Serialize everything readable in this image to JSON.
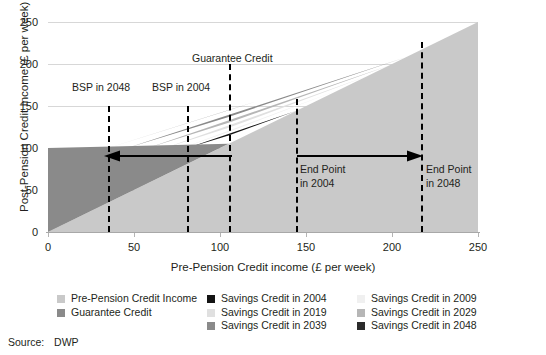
{
  "chart_data": {
    "type": "area",
    "title": "",
    "xlabel": "Pre-Pension Credit income (£ per week)",
    "ylabel": "Post-Pension Credit Income (£ per week)",
    "xlim": [
      0,
      250
    ],
    "ylim": [
      0,
      250
    ],
    "xticks": [
      0,
      50,
      100,
      150,
      200,
      250
    ],
    "yticks": [
      0,
      50,
      100,
      150,
      200,
      250
    ],
    "grid": true,
    "legend_position": "bottom",
    "series": [
      {
        "name": "Pre-Pension Credit Income",
        "color": "#c9c9c9",
        "description": "Identity line y = x filling the area below it across the whole range"
      },
      {
        "name": "Guarantee Credit",
        "color": "#8a8a8a",
        "description": "Flat top-up to £100 per week for pre-credit income between 0 and 105",
        "points": [
          [
            0,
            100
          ],
          [
            105,
            105
          ]
        ]
      },
      {
        "name": "Savings Credit in 2004",
        "color": "#141414",
        "description": "Savings credit taper from BSP in 2004 (£81) to end point in 2004 (£144)",
        "points": [
          [
            81,
            100
          ],
          [
            105,
            115
          ],
          [
            144,
            144
          ]
        ]
      },
      {
        "name": "Savings Credit in 2009",
        "color": "#f0f0f0",
        "description": "Savings credit band, 2009 taper",
        "points": [
          [
            78,
            100
          ],
          [
            105,
            119
          ],
          [
            170,
            170
          ]
        ]
      },
      {
        "name": "Savings Credit in 2019",
        "color": "#e0e0e0",
        "description": "Savings credit band, 2019 taper",
        "points": [
          [
            68,
            100
          ],
          [
            105,
            124
          ],
          [
            185,
            185
          ]
        ]
      },
      {
        "name": "Savings Credit in 2029",
        "color": "#b6b6b6",
        "description": "Savings credit band, 2029 taper",
        "points": [
          [
            58,
            100
          ],
          [
            105,
            130
          ],
          [
            198,
            198
          ]
        ]
      },
      {
        "name": "Savings Credit in 2039",
        "color": "#8a8a8a",
        "description": "Savings credit band, 2039 taper",
        "points": [
          [
            46,
            100
          ],
          [
            105,
            137
          ],
          [
            208,
            208
          ]
        ]
      },
      {
        "name": "Savings Credit in 2048",
        "color": "#2b2b2b",
        "description": "Savings credit band, 2048 taper; topmost band reaching end point in 2048 (£217)",
        "points": [
          [
            35,
            100
          ],
          [
            105,
            145
          ],
          [
            217,
            217
          ]
        ]
      }
    ],
    "markers": [
      {
        "label": "BSP in 2048",
        "x": 35,
        "type": "vertical-dashed"
      },
      {
        "label": "BSP in 2004",
        "x": 81,
        "type": "vertical-dashed"
      },
      {
        "label": "Guarantee Credit",
        "x": 105,
        "type": "vertical-dashed"
      },
      {
        "label": "End Point in 2004",
        "x": 144,
        "type": "vertical-dashed"
      },
      {
        "label": "End Point in 2048",
        "x": 217,
        "type": "vertical-dashed"
      }
    ],
    "arrows": [
      {
        "from_x": 81,
        "to_x": 35,
        "y": 78,
        "direction": "left"
      },
      {
        "from_x": 144,
        "to_x": 217,
        "y": 78,
        "direction": "right"
      }
    ]
  },
  "axes": {
    "y_title": "Post-Pension Credit Income (£ per week)",
    "x_title": "Pre-Pension Credit income (£ per week)",
    "y_ticks": [
      "250",
      "200",
      "150",
      "100",
      "50",
      "0"
    ],
    "x_ticks": [
      "0",
      "50",
      "100",
      "150",
      "200",
      "250"
    ]
  },
  "annotations": {
    "bsp_2048": "BSP in 2048",
    "bsp_2004": "BSP in 2004",
    "guarantee_credit": "Guarantee Credit",
    "end_point_2004_line1": "End Point",
    "end_point_2004_line2": "in 2004",
    "end_point_2048_line1": "End Point",
    "end_point_2048_line2": "in 2048"
  },
  "legend": {
    "column1": [
      {
        "label": "Pre-Pension Credit Income",
        "color": "#c9c9c9"
      },
      {
        "label": "Guarantee Credit",
        "color": "#8a8a8a"
      }
    ],
    "column2": [
      {
        "label": "Savings Credit in 2004",
        "color": "#141414"
      },
      {
        "label": "Savings Credit in 2019",
        "color": "#e0e0e0"
      },
      {
        "label": "Savings Credit in 2039",
        "color": "#8a8a8a"
      }
    ],
    "column3": [
      {
        "label": "Savings Credit in 2009",
        "color": "#f0f0f0"
      },
      {
        "label": "Savings Credit in 2029",
        "color": "#b6b6b6"
      },
      {
        "label": "Savings Credit in 2048",
        "color": "#2b2b2b"
      }
    ]
  },
  "source": {
    "label": "Source:",
    "value": "DWP"
  },
  "colors": {
    "background": "#ffffff",
    "gridline": "#d7d7d7",
    "axis": "#a8a8a8",
    "text": "#231f20",
    "dashed_line": "#000000"
  }
}
